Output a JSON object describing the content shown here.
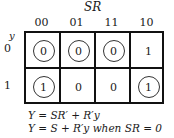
{
  "kmap": {
    "column_variable": "SR",
    "row_variable": "y",
    "column_headers": [
      "00",
      "01",
      "11",
      "10"
    ],
    "row_headers": [
      "0",
      "1"
    ],
    "cells": [
      [
        {
          "value": "0",
          "circled": true
        },
        {
          "value": "0",
          "circled": true
        },
        {
          "value": "0",
          "circled": true
        },
        {
          "value": "1",
          "circled": false
        }
      ],
      [
        {
          "value": "1",
          "circled": true
        },
        {
          "value": "0",
          "circled": false
        },
        {
          "value": "0",
          "circled": false
        },
        {
          "value": "1",
          "circled": true
        }
      ]
    ]
  },
  "equations": [
    "Y = SR′ + R′y",
    "Y = S + R′y when SR = 0"
  ]
}
